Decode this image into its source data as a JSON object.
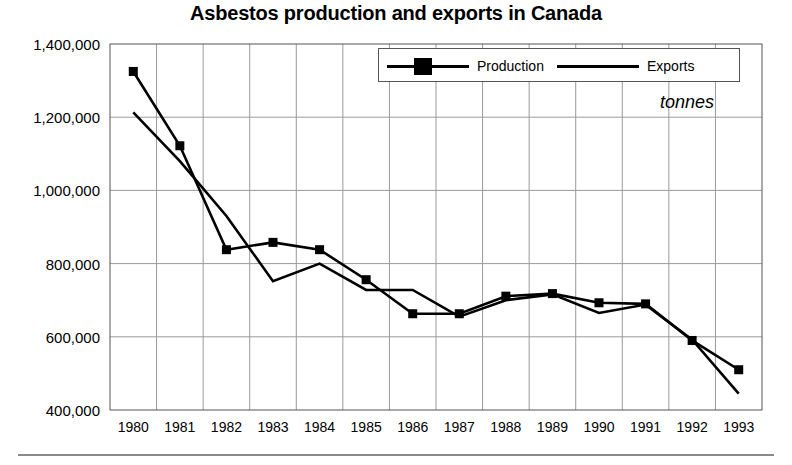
{
  "chart_data": {
    "type": "line",
    "title": "Asbestos production and exports in Canada",
    "subtitle": "",
    "unit_annotation": "tonnes",
    "xlabel": "",
    "ylabel": "",
    "grid": true,
    "legend_position": "top-right",
    "categories": [
      "1980",
      "1981",
      "1982",
      "1983",
      "1984",
      "1985",
      "1986",
      "1987",
      "1988",
      "1989",
      "1990",
      "1991",
      "1992",
      "1993"
    ],
    "ylim": [
      400000,
      1400000
    ],
    "ytick_labels": [
      "1,400,000",
      "1,200,000",
      "1,000,000",
      "800,000",
      "600,000",
      "400,000"
    ],
    "ytick_values": [
      1400000,
      1200000,
      1000000,
      800000,
      600000,
      400000
    ],
    "series": [
      {
        "name": "Production",
        "marker": "square",
        "values": [
          1325000,
          1122000,
          838000,
          858000,
          838000,
          756000,
          663000,
          663000,
          711000,
          718000,
          693000,
          690000,
          590000,
          510000
        ]
      },
      {
        "name": "Exports",
        "marker": "none",
        "values": [
          1213000,
          1080000,
          930000,
          752000,
          800000,
          728000,
          728000,
          655000,
          700000,
          716000,
          665000,
          688000,
          592000,
          445000
        ]
      }
    ]
  },
  "legend": {
    "production_label": "Production",
    "exports_label": "Exports"
  },
  "colors": {
    "line": "#000000",
    "grid": "#9a9a9a",
    "axis": "#555555",
    "background": "#ffffff"
  }
}
